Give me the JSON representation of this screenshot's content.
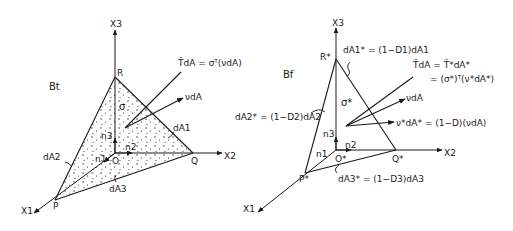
{
  "figure": {
    "left_panel": {
      "config_label": "Bt",
      "axes": {
        "x1": "X1",
        "x2": "X2",
        "x3": "X3"
      },
      "vertices": {
        "origin": "O",
        "p": "P",
        "q": "Q",
        "r": "R"
      },
      "normals": {
        "n1": "n1",
        "n2": "n2",
        "n3": "n3"
      },
      "stress_symbol": "σ",
      "areas": {
        "da1": "dA1",
        "da2": "dA2",
        "da3": "dA3"
      },
      "traction_label": "T̃dA = σᵀ(νdA)",
      "normal_label": "νdA",
      "shaded": true
    },
    "right_panel": {
      "config_label": "Bf",
      "axes": {
        "x1": "X1",
        "x2": "X2",
        "x3": "X3"
      },
      "vertices": {
        "origin": "O*",
        "p": "P*",
        "q": "Q*",
        "r": "R*"
      },
      "normals": {
        "n1": "n1",
        "n2": "n2",
        "n3": "n3"
      },
      "stress_symbol": "σ*",
      "areas": {
        "da1": "dA1* = (1−D1)dA1",
        "da2": "dA2* = (1−D2)dA2",
        "da3": "dA3* = (1−D3)dA3"
      },
      "traction_label_line1": "T̃dA = T̃*dA*",
      "traction_label_line2": "= (σ*)ᵀ(ν*dA*)",
      "normal_label": "νdA",
      "effective_normal_label": "ν*dA* = (1−D)(νdA)",
      "shaded": false
    }
  }
}
